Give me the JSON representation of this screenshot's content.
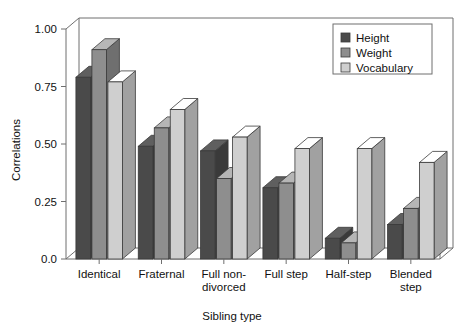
{
  "chart_data": {
    "type": "bar",
    "title": "",
    "xlabel": "Sibling type",
    "ylabel": "Correlations",
    "categories": [
      "Identical",
      "Fraternal",
      "Full non-divorced",
      "Full step",
      "Half-step",
      "Blended step"
    ],
    "category_lines": [
      [
        "Identical"
      ],
      [
        "Fraternal"
      ],
      [
        "Full non-",
        "divorced"
      ],
      [
        "Full step"
      ],
      [
        "Half-step"
      ],
      [
        "Blended",
        "step"
      ]
    ],
    "series": [
      {
        "name": "Height",
        "color": "#4a4a4a",
        "values": [
          0.79,
          0.49,
          0.47,
          0.31,
          0.09,
          0.15
        ]
      },
      {
        "name": "Weight",
        "color": "#8e8e8e",
        "values": [
          0.91,
          0.57,
          0.35,
          0.33,
          0.07,
          0.22
        ]
      },
      {
        "name": "Vocabulary",
        "color": "#cfcfcf",
        "values": [
          0.77,
          0.65,
          0.53,
          0.48,
          0.48,
          0.42
        ]
      }
    ],
    "ylim": [
      0.0,
      1.0
    ],
    "yticks": [
      0.0,
      0.25,
      0.5,
      0.75,
      1.0
    ],
    "ytick_labels": [
      "0.0",
      "0.25",
      "0.50",
      "0.75",
      "1.00"
    ],
    "grid": false,
    "legend_position": "top-right",
    "legend_entries": [
      "Height",
      "Weight",
      "Vocabulary"
    ]
  }
}
